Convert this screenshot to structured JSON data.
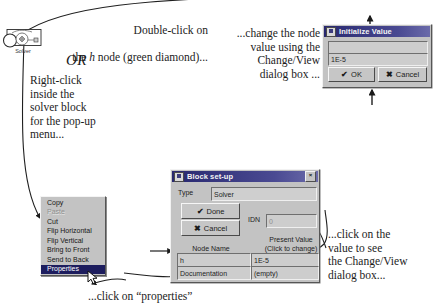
{
  "annotations": {
    "double_click": "Double-click on\nthe h node (green diamond)...",
    "double_click_line1": "Double-click on",
    "double_click_line2_pre": "the ",
    "double_click_line2_italic": "h",
    "double_click_line2_post": " node (green diamond)...",
    "or": "OR",
    "right_click": "Right-click\ninside the\nsolver block\nfor the pop-up\nmenu...",
    "change_value": "...change the node\nvalue using the\nChange/View\ndialog box ...",
    "click_value": "...click on the\nvalue to see\nthe Change/View\ndialog box...",
    "click_properties": "...click on “properties”"
  },
  "solver_block": {
    "caption": "Solver"
  },
  "context_menu": {
    "items": [
      {
        "label": "Copy",
        "state": "normal"
      },
      {
        "label": "Paste",
        "state": "disabled"
      },
      {
        "label": "Cut",
        "state": "normal"
      },
      {
        "label": "Flip Horizontal",
        "state": "normal"
      },
      {
        "label": "Flip Vertical",
        "state": "normal"
      },
      {
        "label": "Bring to Front",
        "state": "normal"
      },
      {
        "label": "Send to Back",
        "state": "normal"
      },
      {
        "label": "Properties",
        "state": "selected"
      }
    ]
  },
  "block_setup_dialog": {
    "title": "Block set-up",
    "close_label": "×",
    "type_label": "Type",
    "type_value": "Solver",
    "done_label": "Done",
    "done_glyph": "✔",
    "cancel_label": "Cancel",
    "cancel_glyph": "✖",
    "idn_label": "IDN",
    "idn_value": "0",
    "node_name_label": "Node Name",
    "node_name_value": "h",
    "present_value_label_line1": "Present Value",
    "present_value_label_line2": "(Click to change)",
    "present_value": "1E-5",
    "documentation_label": "Documentation",
    "documentation_value": "(empty)"
  },
  "initialize_value_dialog": {
    "title": "Initialize Value",
    "field_top_value": "",
    "field_bottom_value": "1E-5",
    "ok_label": "OK",
    "ok_glyph": "✔",
    "cancel_label": "Cancel",
    "cancel_glyph": "✖"
  },
  "colors": {
    "titlebar": "#2a2a7a",
    "dialog_face": "#c3c3c3",
    "menu_highlight": "#1d1d5e",
    "paper": "#ffffff",
    "ink": "#1a1a1a"
  }
}
